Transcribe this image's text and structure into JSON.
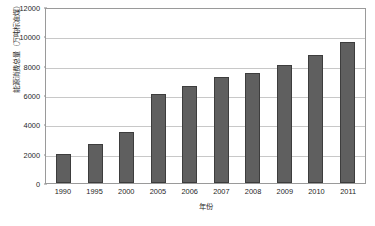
{
  "chart_data": {
    "type": "bar",
    "title": "",
    "xlabel": "年份",
    "ylabel": "能源消费总量（万吨标准煤）",
    "categories": [
      "1990",
      "1995",
      "2000",
      "2005",
      "2006",
      "2007",
      "2008",
      "2009",
      "2010",
      "2011"
    ],
    "values": [
      2000,
      2650,
      3500,
      6050,
      6600,
      7200,
      7500,
      8050,
      8700,
      9600
    ],
    "series": [
      {
        "name": "能源消费总量",
        "values": [
          2000,
          2650,
          3500,
          6050,
          6600,
          7200,
          7500,
          8050,
          8700,
          9600
        ]
      }
    ],
    "ylim": [
      0,
      12000
    ],
    "yticks": [
      0,
      2000,
      4000,
      6000,
      8000,
      10000,
      12000
    ],
    "ytick_labels": [
      "0",
      "2000",
      "4000",
      "6000",
      "8000",
      "10000",
      "12000"
    ],
    "grid": true,
    "grid_axis": "y",
    "legend": false,
    "legend_position": "none",
    "bar_color": "#5f5f5f",
    "bar_edge_color": "#3d3d3d",
    "grid_color": "#c8c8c8",
    "frame_color": "#9a9a9a",
    "background": "#ffffff"
  }
}
